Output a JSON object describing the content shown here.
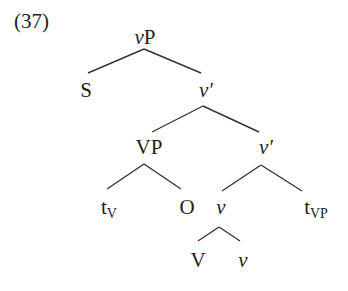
{
  "example_number": "(37)",
  "tree": {
    "nodes": {
      "vP": {
        "head": "v",
        "rest": "P"
      },
      "S": {
        "text": "S"
      },
      "v_bar1": {
        "head": "v",
        "rest": "′"
      },
      "VP": {
        "text": "VP"
      },
      "v_bar2": {
        "head": "v",
        "rest": "′"
      },
      "tV": {
        "base": "t",
        "sub": "V"
      },
      "O": {
        "text": "O"
      },
      "v_head": {
        "text": "v"
      },
      "tVP": {
        "base": "t",
        "sub": "VP"
      },
      "V": {
        "text": "V"
      },
      "v_affix": {
        "text": "v"
      }
    },
    "edges": [
      [
        "vP",
        "S"
      ],
      [
        "vP",
        "v_bar1"
      ],
      [
        "v_bar1",
        "VP"
      ],
      [
        "v_bar1",
        "v_bar2"
      ],
      [
        "VP",
        "tV"
      ],
      [
        "VP",
        "O"
      ],
      [
        "v_bar2",
        "v_head"
      ],
      [
        "v_bar2",
        "tVP"
      ],
      [
        "v_head",
        "V"
      ],
      [
        "v_head",
        "v_affix"
      ]
    ]
  },
  "colors": {
    "text": "#1e1e1e",
    "line": "#333333"
  }
}
